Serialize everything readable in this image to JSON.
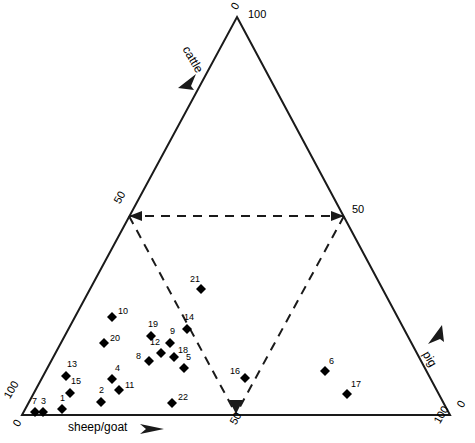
{
  "figure": {
    "type": "ternary-scatter",
    "background": "#ffffff",
    "line_color": "#1a1a1a",
    "marker_color": "#000000"
  },
  "axes": {
    "left": {
      "name": "cattle",
      "arrow": "arrow-up-left"
    },
    "right": {
      "name": "pig",
      "arrow": "arrow-up-right"
    },
    "bottom": {
      "name": "sheep/goat",
      "arrow": "arrow-right"
    }
  },
  "ticks": {
    "apex_cattle_100": "100",
    "apex_cattle_0_left": "0",
    "left_mid_50": "50",
    "right_mid_50": "50",
    "bottom_left_100": "100",
    "bottom_left_0": "0",
    "bottom_mid_50": "50",
    "bottom_right_0": "0",
    "bottom_right_100": "100"
  },
  "chart_data": {
    "type": "scatter",
    "title": "",
    "xlabel": "sheep/goat",
    "ylabel": "cattle",
    "zlabel": "pig",
    "ternary_axes": [
      "sheep/goat",
      "cattle",
      "pig"
    ],
    "axis_ranges": {
      "sheep/goat": [
        0,
        100
      ],
      "cattle": [
        0,
        100
      ],
      "pig": [
        0,
        100
      ]
    },
    "grid": false,
    "legend": "none",
    "annotations": [
      "dashed inner triangle delimiting the 50% sub-triangle"
    ],
    "dashed_guides": [
      {
        "from": "left-edge-50",
        "to": "right-edge-50"
      },
      {
        "from": "left-edge-50",
        "to": "bottom-50"
      },
      {
        "from": "right-edge-50",
        "to": "bottom-50"
      }
    ],
    "points": [
      {
        "label": "1",
        "px": 62.0,
        "py": 409.0,
        "sheep_goat": 11.0,
        "cattle": 1.5,
        "pig": 87.5
      },
      {
        "label": "2",
        "px": 101.0,
        "py": 402.0,
        "sheep_goat": 19.0,
        "cattle": 3.3,
        "pig": 77.7
      },
      {
        "label": "3",
        "px": 43.0,
        "py": 412.0,
        "sheep_goat": 6.5,
        "cattle": 0.8,
        "pig": 92.7
      },
      {
        "label": "4",
        "px": 112.0,
        "py": 379.0,
        "sheep_goat": 19.0,
        "cattle": 9.0,
        "pig": 72.0
      },
      {
        "label": "5",
        "px": 184.0,
        "py": 368.0,
        "sheep_goat": 34.0,
        "cattle": 11.8,
        "pig": 54.2
      },
      {
        "label": "6",
        "px": 325.0,
        "py": 371.0,
        "sheep_goat": 66.0,
        "cattle": 11.1,
        "pig": 22.9
      },
      {
        "label": "7",
        "px": 35.0,
        "py": 412.0,
        "sheep_goat": 5.0,
        "cattle": 0.8,
        "pig": 94.2
      },
      {
        "label": "8",
        "px": 149.0,
        "py": 361.0,
        "sheep_goat": 25.0,
        "cattle": 13.6,
        "pig": 61.4
      },
      {
        "label": "9",
        "px": 170.0,
        "py": 343.0,
        "sheep_goat": 28.0,
        "cattle": 18.1,
        "pig": 53.9
      },
      {
        "label": "10",
        "px": 112.0,
        "py": 317.0,
        "sheep_goat": 15.0,
        "cattle": 24.6,
        "pig": 60.4
      },
      {
        "label": "11",
        "px": 119.0,
        "py": 390.0,
        "sheep_goat": 22.0,
        "cattle": 6.3,
        "pig": 71.7
      },
      {
        "label": "12",
        "px": 161.0,
        "py": 353.0,
        "sheep_goat": 27.0,
        "cattle": 15.6,
        "pig": 57.4
      },
      {
        "label": "13",
        "px": 66.0,
        "py": 376.0,
        "sheep_goat": 9.0,
        "cattle": 9.8,
        "pig": 81.2
      },
      {
        "label": "14",
        "px": 187.0,
        "py": 329.0,
        "sheep_goat": 31.0,
        "cattle": 21.6,
        "pig": 47.4
      },
      {
        "label": "15",
        "px": 70.0,
        "py": 393.0,
        "sheep_goat": 11.0,
        "cattle": 5.5,
        "pig": 83.5
      },
      {
        "label": "16",
        "px": 245.0,
        "py": 378.0,
        "sheep_goat": 46.0,
        "cattle": 9.3,
        "pig": 44.7
      },
      {
        "label": "17",
        "px": 347.0,
        "py": 394.0,
        "sheep_goat": 74.0,
        "cattle": 5.3,
        "pig": 20.7
      },
      {
        "label": "18",
        "px": 174.0,
        "py": 357.0,
        "sheep_goat": 30.0,
        "cattle": 14.6,
        "pig": 55.4
      },
      {
        "label": "19",
        "px": 151.0,
        "py": 336.0,
        "sheep_goat": 24.0,
        "cattle": 19.8,
        "pig": 56.2
      },
      {
        "label": "20",
        "px": 104.0,
        "py": 343.0,
        "sheep_goat": 15.0,
        "cattle": 18.1,
        "pig": 66.9
      },
      {
        "label": "21",
        "px": 201.0,
        "py": 289.0,
        "sheep_goat": 31.0,
        "cattle": 31.7,
        "pig": 37.3
      },
      {
        "label": "22",
        "px": 172.0,
        "py": 403.0,
        "sheep_goat": 34.0,
        "cattle": 3.0,
        "pig": 63.0
      }
    ]
  }
}
